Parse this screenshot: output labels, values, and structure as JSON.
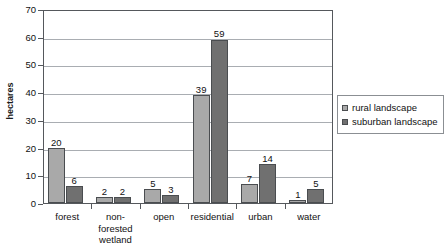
{
  "chart_data": {
    "type": "bar",
    "title": "",
    "subtitle": "",
    "xlabel": "",
    "ylabel": "hectares",
    "ylim": [
      0,
      70
    ],
    "ytick_step": 10,
    "yticks": [
      70,
      60,
      50,
      40,
      30,
      20,
      10,
      0
    ],
    "grid": true,
    "legend_position": "right",
    "categories": [
      "forest",
      "non-\nforested\nwetland",
      "open",
      "residential",
      "urban",
      "water"
    ],
    "series": [
      {
        "name": "rural landscape",
        "color": "#a9a9a9",
        "values": [
          20,
          2,
          5,
          39,
          7,
          1
        ]
      },
      {
        "name": "suburban landscape",
        "color": "#707070",
        "values": [
          6,
          2,
          3,
          59,
          14,
          5
        ]
      }
    ],
    "data_labels": [
      [
        "20",
        "2",
        "5",
        "39",
        "7",
        "1"
      ],
      [
        "6",
        "2",
        "3",
        "59",
        "14",
        "5"
      ]
    ]
  },
  "axis": {
    "y_title": "hectares",
    "y_labels": [
      "70",
      "60",
      "50",
      "40",
      "30",
      "20",
      "10",
      "0"
    ]
  },
  "legend": {
    "items": [
      {
        "label": "rural landscape"
      },
      {
        "label": "suburban landscape"
      }
    ]
  }
}
